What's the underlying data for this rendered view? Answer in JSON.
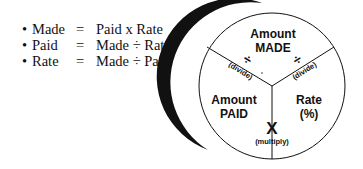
{
  "formulas": [
    {
      "bullet": "•",
      "lhs": "Made",
      "eq": "=",
      "rhs": "Paid x Rate"
    },
    {
      "bullet": "•",
      "lhs": "Paid",
      "eq": "=",
      "rhs": "Made ÷ Rate"
    },
    {
      "bullet": "•",
      "lhs": "Rate",
      "eq": "=",
      "rhs": "Made ÷ Paid"
    }
  ],
  "circle": {
    "top": {
      "line1": "Amount",
      "line2": "MADE"
    },
    "left": {
      "line1": "Amount",
      "line2": "PAID"
    },
    "right": {
      "line1": "Rate",
      "line2": "(%)"
    },
    "divide_left": {
      "symbol": "÷",
      "label": "(divide)"
    },
    "divide_right": {
      "symbol": "÷",
      "label": "(divide)"
    },
    "multiply": {
      "symbol": "X",
      "label": "(multiply)"
    }
  }
}
